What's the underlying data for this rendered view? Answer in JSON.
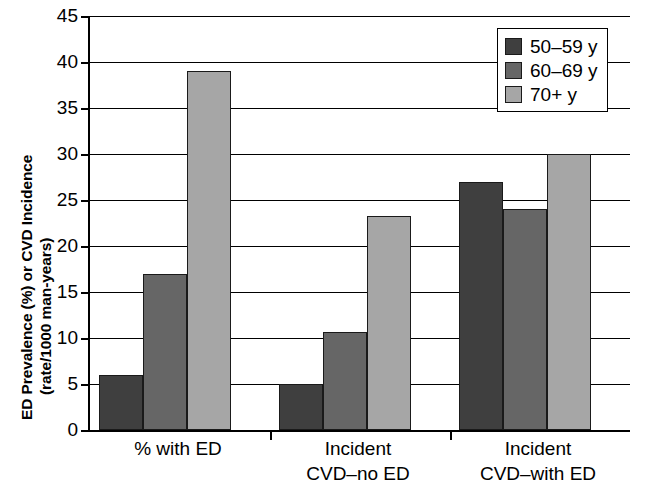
{
  "chart_data": {
    "type": "bar",
    "title": "",
    "subtitle": "",
    "xlabel": "",
    "ylabel": "ED Prevalence (%) or CVD Incidence (rate/1000 man-years)",
    "ylabel_lines": [
      "ED Prevalence (%) or CVD Incidence",
      "(rate/1000 man-years)"
    ],
    "categories": [
      "% with ED",
      "Incident CVD–no ED",
      "Incident CVD–with ED"
    ],
    "category_lines": [
      [
        "% with ED"
      ],
      [
        "Incident",
        "CVD–no ED"
      ],
      [
        "Incident",
        "CVD–with ED"
      ]
    ],
    "series": [
      {
        "name": "50–59 y",
        "color": "#3f3f3f",
        "values": [
          6,
          5,
          27
        ]
      },
      {
        "name": "60–69 y",
        "color": "#666666",
        "values": [
          17,
          10.7,
          24
        ]
      },
      {
        "name": "70+ y",
        "color": "#a6a6a6",
        "values": [
          39,
          23.3,
          30
        ]
      }
    ],
    "ylim": [
      0,
      45
    ],
    "ytick_values": [
      0,
      5,
      10,
      15,
      20,
      25,
      30,
      35,
      40,
      45
    ],
    "ytick_labels": [
      "0",
      "5",
      "10",
      "15",
      "20",
      "25",
      "30",
      "35",
      "40",
      "45"
    ],
    "grid": true,
    "grid_axis": "y",
    "legend_position": "top-right",
    "legend_entries": [
      "50–59 y",
      "60–69 y",
      "70+ y"
    ]
  }
}
